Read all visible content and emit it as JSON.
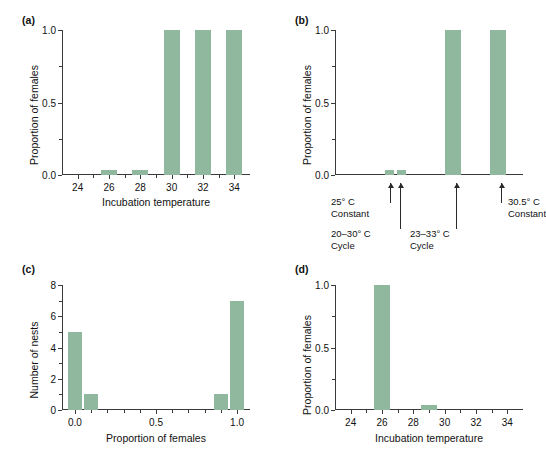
{
  "figure": {
    "background": "#ffffff",
    "bar_color": "#8fb89e",
    "axis_color": "#3a3a3a"
  },
  "panels": {
    "a": {
      "label": "(a)",
      "xlabel": "Incubation temperature",
      "ylabel": "Proportion of females"
    },
    "b": {
      "label": "(b)",
      "ylabel": "Proportion of females",
      "annotations": [
        {
          "line1": "25° C",
          "line2": "Constant"
        },
        {
          "line1": "20–30° C",
          "line2": "Cycle"
        },
        {
          "line1": "23–33° C",
          "line2": "Cycle"
        },
        {
          "line1": "30.5° C",
          "line2": "Constant"
        }
      ]
    },
    "c": {
      "label": "(c)",
      "xlabel": "Proportion of females",
      "ylabel": "Number of nests"
    },
    "d": {
      "label": "(d)",
      "xlabel": "Incubation temperature",
      "ylabel": "Proportion of females"
    }
  },
  "chart_data": [
    {
      "id": "a",
      "type": "bar",
      "title": "(a)",
      "xlabel": "Incubation temperature",
      "ylabel": "Proportion of females",
      "xlim": [
        23,
        35
      ],
      "ylim": [
        0,
        1
      ],
      "xticks": [
        24,
        26,
        28,
        30,
        32,
        34
      ],
      "xtick_labels": [
        "24",
        "26",
        "28",
        "30",
        "32",
        "34"
      ],
      "xticks_minor": [
        25,
        27,
        29,
        31,
        33
      ],
      "yticks": [
        0.0,
        0.5,
        1.0
      ],
      "ytick_labels": [
        "0.0",
        "0.5",
        "1.0"
      ],
      "yticks_minor": [
        0.25,
        0.75
      ],
      "grid": false,
      "categories": [
        26,
        28,
        30,
        32,
        34
      ],
      "values": [
        0.02,
        0.02,
        1.0,
        1.0,
        1.0
      ]
    },
    {
      "id": "b",
      "type": "bar",
      "title": "(b)",
      "xlabel": "",
      "ylabel": "Proportion of females",
      "ylim": [
        0,
        1
      ],
      "yticks": [
        0.0,
        0.5,
        1.0
      ],
      "ytick_labels": [
        "0.0",
        "0.5",
        "1.0"
      ],
      "yticks_minor": [
        0.25,
        0.75
      ],
      "xticks": [],
      "xtick_labels": [],
      "grid": false,
      "categories": [
        "25° C Constant",
        "20–30° C Cycle",
        "23–33° C Cycle",
        "30.5° C Constant"
      ],
      "values": [
        0.02,
        0.02,
        1.0,
        1.0
      ]
    },
    {
      "id": "c",
      "type": "bar",
      "title": "(c)",
      "xlabel": "Proportion of females",
      "ylabel": "Number of nests",
      "xlim": [
        -0.08,
        1.08
      ],
      "ylim": [
        0,
        8
      ],
      "xticks": [
        0.0,
        0.5,
        1.0
      ],
      "xtick_labels": [
        "0.0",
        "0.5",
        "1.0"
      ],
      "xticks_minor": [
        0.1,
        0.2,
        0.3,
        0.4,
        0.6,
        0.7,
        0.8,
        0.9
      ],
      "yticks": [
        0,
        2,
        4,
        6,
        8
      ],
      "ytick_labels": [
        "0",
        "2",
        "4",
        "6",
        "8"
      ],
      "yticks_minor": [
        1,
        3,
        5,
        7
      ],
      "grid": false,
      "categories": [
        0.0,
        0.1,
        0.9,
        1.0
      ],
      "values": [
        5,
        1,
        1,
        7
      ]
    },
    {
      "id": "d",
      "type": "bar",
      "title": "(d)",
      "xlabel": "Incubation temperature",
      "ylabel": "Proportion of females",
      "xlim": [
        23,
        35
      ],
      "ylim": [
        0,
        1
      ],
      "xticks": [
        24,
        26,
        28,
        30,
        32,
        34
      ],
      "xtick_labels": [
        "24",
        "26",
        "28",
        "30",
        "32",
        "34"
      ],
      "xticks_minor": [
        25,
        27,
        29,
        31,
        33
      ],
      "yticks": [
        0.0,
        0.5,
        1.0
      ],
      "ytick_labels": [
        "0.0",
        "0.5",
        "1.0"
      ],
      "yticks_minor": [
        0.25,
        0.75
      ],
      "grid": false,
      "categories": [
        26,
        29
      ],
      "values": [
        1.0,
        0.02
      ]
    }
  ]
}
